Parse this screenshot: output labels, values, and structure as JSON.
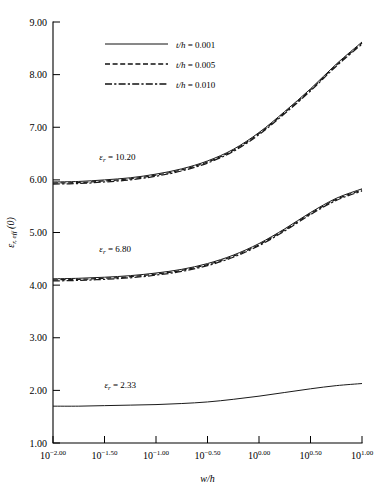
{
  "chart_data": {
    "type": "line",
    "title": "",
    "subtitle": "",
    "xlabel": "w/h",
    "ylabel": "ε r, eff (0)",
    "xscale": "log10-exponent",
    "xlim": [
      -2.0,
      1.0
    ],
    "ylim": [
      1.0,
      9.0
    ],
    "grid": false,
    "legend_position": "top-center",
    "x_tick_labels": [
      {
        "base": "10",
        "exp": "−2.00",
        "value": -2.0
      },
      {
        "base": "10",
        "exp": "−1.50",
        "value": -1.5
      },
      {
        "base": "10",
        "exp": "−1.00",
        "value": -1.0
      },
      {
        "base": "10",
        "exp": "−0.50",
        "value": -0.5
      },
      {
        "base": "10",
        "exp": "0.00",
        "value": 0.0
      },
      {
        "base": "10",
        "exp": "0.50",
        "value": 0.5
      },
      {
        "base": "10",
        "exp": "1.00",
        "value": 1.0
      }
    ],
    "y_tick_labels": [
      "9.00",
      "8.00",
      "7.00",
      "6.00",
      "5.00",
      "4.00",
      "3.00",
      "2.00",
      "1.00"
    ],
    "y_tick_values": [
      9.0,
      8.0,
      7.0,
      6.0,
      5.0,
      4.0,
      3.0,
      2.0,
      1.0
    ],
    "legend": [
      {
        "label": "t/h = 0.001",
        "style": "solid",
        "var": "t/h",
        "value": "0.001"
      },
      {
        "label": "t/h = 0.005",
        "style": "dashed",
        "var": "t/h",
        "value": "0.005"
      },
      {
        "label": "t/h = 0.010",
        "style": "dash-dot",
        "var": "t/h",
        "value": "0.010"
      }
    ],
    "annotations": [
      {
        "text": "ε r = 10.20",
        "var": "ε",
        "sub": "r",
        "value": "10.20",
        "x": -1.55,
        "y": 6.38
      },
      {
        "text": "ε r = 6.80",
        "var": "ε",
        "sub": "r",
        "value": "6.80",
        "x": -1.55,
        "y": 4.62
      },
      {
        "text": "ε r = 2.33",
        "var": "ε",
        "sub": "r",
        "value": "2.33",
        "x": -1.5,
        "y": 2.04
      }
    ],
    "groups": [
      {
        "name": "eps_r = 10.20",
        "eps_r": 10.2,
        "series": [
          {
            "name": "t/h = 0.001",
            "style": "solid",
            "x": [
              -2.0,
              -1.75,
              -1.5,
              -1.25,
              -1.0,
              -0.75,
              -0.5,
              -0.25,
              0.0,
              0.25,
              0.5,
              0.75,
              1.0
            ],
            "y": [
              5.96,
              5.97,
              6.0,
              6.04,
              6.11,
              6.21,
              6.36,
              6.58,
              6.9,
              7.3,
              7.73,
              8.2,
              8.62
            ]
          },
          {
            "name": "t/h = 0.005",
            "style": "dashed",
            "x": [
              -2.0,
              -1.75,
              -1.5,
              -1.25,
              -1.0,
              -0.75,
              -0.5,
              -0.25,
              0.0,
              0.25,
              0.5,
              0.75,
              1.0
            ],
            "y": [
              5.94,
              5.95,
              5.98,
              6.02,
              6.09,
              6.19,
              6.34,
              6.56,
              6.88,
              7.28,
              7.71,
              8.18,
              8.6
            ]
          },
          {
            "name": "t/h = 0.010",
            "style": "dash-dot",
            "x": [
              -2.0,
              -1.75,
              -1.5,
              -1.25,
              -1.0,
              -0.75,
              -0.5,
              -0.25,
              0.0,
              0.25,
              0.5,
              0.75,
              1.0
            ],
            "y": [
              5.92,
              5.93,
              5.96,
              6.0,
              6.07,
              6.17,
              6.32,
              6.54,
              6.86,
              7.26,
              7.69,
              8.16,
              8.58
            ]
          }
        ]
      },
      {
        "name": "eps_r = 6.80",
        "eps_r": 6.8,
        "series": [
          {
            "name": "t/h = 0.001",
            "style": "solid",
            "x": [
              -2.0,
              -1.75,
              -1.5,
              -1.25,
              -1.0,
              -0.75,
              -0.5,
              -0.25,
              0.0,
              0.25,
              0.5,
              0.75,
              1.0
            ],
            "y": [
              4.12,
              4.13,
              4.15,
              4.18,
              4.23,
              4.3,
              4.41,
              4.57,
              4.79,
              5.07,
              5.38,
              5.65,
              5.83
            ]
          },
          {
            "name": "t/h = 0.005",
            "style": "dashed",
            "x": [
              -2.0,
              -1.75,
              -1.5,
              -1.25,
              -1.0,
              -0.75,
              -0.5,
              -0.25,
              0.0,
              0.25,
              0.5,
              0.75,
              1.0
            ],
            "y": [
              4.1,
              4.11,
              4.13,
              4.16,
              4.21,
              4.28,
              4.39,
              4.55,
              4.77,
              5.05,
              5.36,
              5.63,
              5.81
            ]
          },
          {
            "name": "t/h = 0.010",
            "style": "dash-dot",
            "x": [
              -2.0,
              -1.75,
              -1.5,
              -1.25,
              -1.0,
              -0.75,
              -0.5,
              -0.25,
              0.0,
              0.25,
              0.5,
              0.75,
              1.0
            ],
            "y": [
              4.08,
              4.09,
              4.11,
              4.14,
              4.19,
              4.26,
              4.37,
              4.53,
              4.75,
              5.03,
              5.34,
              5.61,
              5.79
            ]
          }
        ]
      },
      {
        "name": "eps_r = 2.33",
        "eps_r": 2.33,
        "series": [
          {
            "name": "t/h = 0.001",
            "style": "solid",
            "x": [
              -2.0,
              -1.75,
              -1.5,
              -1.25,
              -1.0,
              -0.75,
              -0.5,
              -0.25,
              0.0,
              0.25,
              0.5,
              0.75,
              1.0
            ],
            "y": [
              1.7,
              1.7,
              1.71,
              1.72,
              1.73,
              1.75,
              1.78,
              1.83,
              1.89,
              1.96,
              2.03,
              2.09,
              2.13
            ]
          }
        ]
      }
    ]
  },
  "figure": {
    "plot_left_px": 53,
    "plot_right_px": 362,
    "plot_top_px": 22,
    "plot_bottom_px": 443
  }
}
